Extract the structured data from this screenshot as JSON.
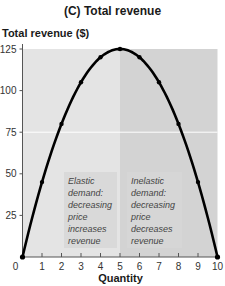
{
  "chart_data": {
    "type": "line",
    "title": "(C) Total revenue",
    "xlabel": "Quantity",
    "ylabel": "Total revenue ($)",
    "x": [
      0,
      1,
      2,
      3,
      4,
      5,
      6,
      7,
      8,
      9,
      10
    ],
    "series": [
      {
        "name": "Total revenue",
        "values": [
          0,
          45,
          80,
          105,
          120,
          125,
          120,
          105,
          80,
          45,
          0
        ]
      }
    ],
    "xlim": [
      0,
      10
    ],
    "ylim": [
      0,
      125
    ],
    "xticks": [
      "0",
      "1",
      "2",
      "3",
      "4",
      "5",
      "6",
      "7",
      "8",
      "9",
      "10"
    ],
    "yticks": [
      "25",
      "50",
      "75",
      "100",
      "125"
    ],
    "regions": [
      {
        "x_range": [
          0,
          5
        ],
        "label": "Elastic demand: decreasing price increases revenue",
        "shade": "#e4e4e4"
      },
      {
        "x_range": [
          5,
          10
        ],
        "label": "Inelastic demand: decreasing price decreases revenue",
        "shade": "#d3d3d3"
      }
    ],
    "grid": false,
    "legend": "none"
  },
  "annotations": {
    "elastic": [
      "Elastic",
      "demand:",
      "decreasing",
      "price",
      "increases",
      "revenue"
    ],
    "inelastic": [
      "Inelastic",
      "demand:",
      "decreasing",
      "price",
      "decreases",
      "revenue"
    ]
  },
  "colors": {
    "curve": "#000000",
    "left_shade": "#e4e4e4",
    "right_shade": "#d3d3d3"
  }
}
